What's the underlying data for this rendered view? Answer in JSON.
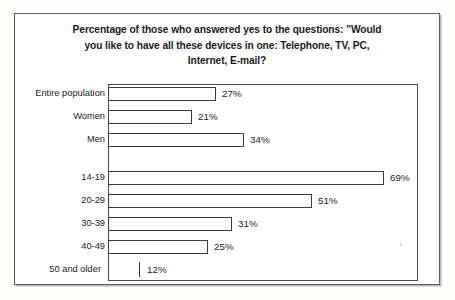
{
  "figure": {
    "title_lines": [
      "Percentage of those who answered yes to the questions: \"Would",
      "you like to have all these devices in one: Telephone, TV, PC,",
      "Internet, E-mail?"
    ],
    "title_full": "Percentage of those who answered yes to the questions: \"Would you like to have all these devices in one: Telephone, TV, PC, Internet, E-mail?"
  },
  "chart_data": {
    "type": "bar",
    "orientation": "horizontal",
    "title": "Percentage of those who answered yes to the questions: \"Would you like to have all these devices in one: Telephone, TV, PC, Internet, E-mail?",
    "xlabel": "",
    "ylabel": "",
    "xlim": [
      0,
      78
    ],
    "grid": false,
    "legend": false,
    "value_suffix": "%",
    "categories": [
      "Entire population",
      "Women",
      "Men",
      "14-19",
      "20-29",
      "30-39",
      "40-49",
      "50 and older"
    ],
    "values": [
      27,
      21,
      34,
      69,
      51,
      31,
      25,
      12
    ],
    "value_labels": [
      "27%",
      "21%",
      "34%",
      "69%",
      "51%",
      "31%",
      "25%",
      "12%"
    ],
    "groups": [
      {
        "name": "population",
        "categories": [
          "Entire population",
          "Women",
          "Men"
        ],
        "values": [
          27,
          21,
          34
        ]
      },
      {
        "name": "age",
        "categories": [
          "14-19",
          "20-29",
          "30-39",
          "40-49",
          "50 and older"
        ],
        "values": [
          69,
          51,
          31,
          25,
          12
        ]
      }
    ],
    "bars": [
      {
        "label": "Entire population",
        "value": 27,
        "value_label": "27%",
        "top": 86,
        "bar_drawn": true
      },
      {
        "label": "Women",
        "value": 21,
        "value_label": "21%",
        "top": 109,
        "bar_drawn": true
      },
      {
        "label": "Men",
        "value": 34,
        "value_label": "34%",
        "top": 132,
        "bar_drawn": true
      },
      {
        "label": "14-19",
        "value": 69,
        "value_label": "69%",
        "top": 170,
        "bar_drawn": true
      },
      {
        "label": "20-29",
        "value": 51,
        "value_label": "51%",
        "top": 193,
        "bar_drawn": true
      },
      {
        "label": "30-39",
        "value": 31,
        "value_label": "31%",
        "top": 216,
        "bar_drawn": true
      },
      {
        "label": "40-49",
        "value": 25,
        "value_label": "25%",
        "top": 239,
        "bar_drawn": true
      },
      {
        "label": "50 and older",
        "value": 12,
        "value_label": "12%",
        "top": 262,
        "bar_drawn": false
      }
    ]
  },
  "style": {
    "bar_fill": "#ffffff",
    "bar_border": "#3a3a3a",
    "frame_color": "#4a4a4a",
    "text_color": "#1a1a1a",
    "page_background": "#fdfdfc",
    "px_per_percent": 4.0,
    "baseline_x": 108
  }
}
